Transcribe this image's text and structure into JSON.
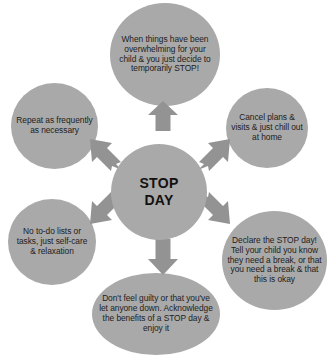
{
  "diagram": {
    "type": "radial-cycle",
    "hub": {
      "line1": "STOP",
      "line2": "DAY",
      "text": "STOP DAY"
    },
    "colors": {
      "node_fill": "#a9a9a9",
      "arrow_fill": "#939393",
      "text": "#1d1d1d",
      "background": "#ffffff"
    },
    "nodes": [
      {
        "id": "top",
        "position": "top",
        "text": "When things have been overwhelming for your child & you just decide to temporarily STOP!"
      },
      {
        "id": "right-top",
        "position": "upper-right",
        "text": "Cancel plans & visits & just chill out at home"
      },
      {
        "id": "right-bottom",
        "position": "lower-right",
        "text": "Declare the STOP day! Tell your child you know they need a break, or that you need a break & that this is okay"
      },
      {
        "id": "bottom",
        "position": "bottom",
        "text": "Don't feel guilty or that you've let anyone down. Acknowledge the benefits of a STOP day & enjoy it"
      },
      {
        "id": "left-bottom",
        "position": "lower-left",
        "text": "No to-do lists or tasks, just self-care & relaxation"
      },
      {
        "id": "left-top",
        "position": "upper-left",
        "text": "Repeat as frequently as necessary"
      }
    ],
    "arrows": [
      {
        "id": "up",
        "direction": "up",
        "icon": "arrow-up-icon"
      },
      {
        "id": "north-east",
        "direction": "upper-right",
        "icon": "arrow-upper-right-icon"
      },
      {
        "id": "south-east",
        "direction": "lower-right",
        "icon": "arrow-lower-right-icon"
      },
      {
        "id": "down",
        "direction": "down",
        "icon": "arrow-down-icon"
      },
      {
        "id": "south-west",
        "direction": "lower-left",
        "icon": "arrow-lower-left-icon"
      },
      {
        "id": "north-west",
        "direction": "upper-left",
        "icon": "arrow-upper-left-icon"
      }
    ]
  }
}
